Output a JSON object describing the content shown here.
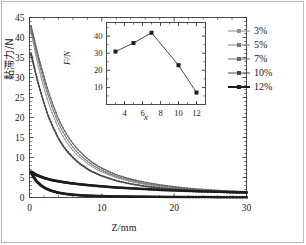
{
  "figure": {
    "width": 306,
    "height": 245,
    "background": "#ffffff",
    "frame_color": "#b9b9b9"
  },
  "legend": {
    "position": "right",
    "items": [
      {
        "label": "3%",
        "color": "#8c8c8c",
        "line_width": 0.9,
        "marker": "square"
      },
      {
        "label": "5%",
        "color": "#7a7a7a",
        "line_width": 1.0,
        "marker": "square"
      },
      {
        "label": "7%",
        "color": "#666666",
        "line_width": 1.1,
        "marker": "square"
      },
      {
        "label": "10%",
        "color": "#4a4a4a",
        "line_width": 1.4,
        "marker": "square"
      },
      {
        "label": "12%",
        "color": "#1c1c1c",
        "line_width": 2.0,
        "marker": "square"
      }
    ]
  },
  "chart_data": [
    {
      "id": "main",
      "type": "line",
      "title": "",
      "xlabel": "Z/mm",
      "ylabel": "黏滞力/N",
      "xlim": [
        0,
        30
      ],
      "ylim": [
        0,
        45
      ],
      "xticks": [
        0,
        10,
        20,
        30
      ],
      "yticks": [
        0,
        5,
        10,
        15,
        20,
        25,
        30,
        35,
        40,
        45
      ],
      "grid": false,
      "legend_position": "right-outside",
      "marker": "square",
      "series": [
        {
          "name": "3%",
          "color": "#8c8c8c",
          "x": [
            0.2,
            0.6,
            1.0,
            1.5,
            2.0,
            2.6,
            3.2,
            4.0,
            5.0,
            6.0,
            7.0,
            8.5,
            10.0,
            12.0,
            14.0,
            16.0,
            19.0,
            22.0,
            25.0,
            28.0,
            30.0
          ],
          "y": [
            41.5,
            38.0,
            34.6,
            30.8,
            27.4,
            23.8,
            20.8,
            17.4,
            14.2,
            11.8,
            10.0,
            7.9,
            6.4,
            5.0,
            4.0,
            3.3,
            2.5,
            2.0,
            1.6,
            1.3,
            1.2
          ]
        },
        {
          "name": "5%",
          "color": "#7a7a7a",
          "x": [
            0.2,
            0.6,
            1.0,
            1.5,
            2.0,
            2.6,
            3.2,
            4.0,
            5.0,
            6.0,
            7.0,
            8.5,
            10.0,
            12.0,
            14.0,
            16.0,
            19.0,
            22.0,
            25.0,
            28.0,
            30.0
          ],
          "y": [
            42.2,
            39.2,
            36.0,
            32.4,
            29.0,
            25.4,
            22.2,
            18.6,
            15.2,
            12.6,
            10.6,
            8.4,
            6.8,
            5.3,
            4.3,
            3.5,
            2.7,
            2.1,
            1.7,
            1.4,
            1.3
          ]
        },
        {
          "name": "7%",
          "color": "#666666",
          "x": [
            0.2,
            0.6,
            1.0,
            1.5,
            2.0,
            2.6,
            3.2,
            4.0,
            5.0,
            6.0,
            7.0,
            8.5,
            10.0,
            12.0,
            14.0,
            16.0,
            19.0,
            22.0,
            25.0,
            28.0,
            30.0
          ],
          "y": [
            42.8,
            40.0,
            37.0,
            33.5,
            30.2,
            26.6,
            23.4,
            19.7,
            16.2,
            13.5,
            11.4,
            9.0,
            7.3,
            5.7,
            4.6,
            3.8,
            2.9,
            2.3,
            1.9,
            1.6,
            1.4
          ]
        },
        {
          "name": "10%",
          "color": "#4a4a4a",
          "x": [
            0.2,
            0.6,
            1.0,
            1.5,
            2.0,
            2.6,
            3.2,
            4.0,
            5.0,
            6.0,
            7.0,
            8.5,
            10.0,
            12.0,
            14.0,
            16.0,
            19.0,
            22.0,
            25.0,
            28.0,
            30.0
          ],
          "y": [
            36.0,
            33.0,
            30.0,
            26.6,
            23.6,
            20.4,
            17.8,
            14.8,
            12.0,
            10.0,
            8.4,
            6.6,
            5.4,
            4.2,
            3.4,
            2.8,
            2.2,
            1.8,
            1.5,
            1.2,
            1.1
          ]
        },
        {
          "name": "12%",
          "color": "#1c1c1c",
          "x": [
            0.2,
            0.6,
            1.0,
            1.6,
            2.2,
            3.0,
            4.0,
            5.0,
            6.0,
            7.5,
            9.0,
            11.0,
            13.0,
            16.0,
            19.0,
            22.0,
            25.0,
            28.0,
            30.0
          ],
          "y": [
            6.4,
            5.0,
            4.0,
            3.0,
            2.3,
            1.7,
            1.2,
            0.9,
            0.7,
            0.5,
            0.4,
            0.3,
            0.25,
            0.2,
            0.15,
            0.12,
            0.1,
            0.08,
            0.07
          ]
        },
        {
          "name": "12%-upper-branch",
          "color": "#1c1c1c",
          "x": [
            0.3,
            1.0,
            2.0,
            3.0,
            4.5,
            6.0,
            8.0,
            10.0,
            12.0,
            15.0,
            18.0,
            21.0,
            24.0,
            27.0,
            30.0
          ],
          "y": [
            6.3,
            5.6,
            4.9,
            4.4,
            3.9,
            3.5,
            3.1,
            2.8,
            2.5,
            2.2,
            1.9,
            1.7,
            1.5,
            1.4,
            1.3
          ]
        }
      ]
    },
    {
      "id": "inset",
      "type": "line",
      "title": "",
      "xlabel": "x",
      "ylabel": "F/N",
      "xlim": [
        2,
        13
      ],
      "ylim": [
        0,
        48
      ],
      "xticks": [
        4,
        6,
        8,
        10,
        12
      ],
      "yticks": [
        10,
        20,
        30,
        40
      ],
      "grid": false,
      "marker": "square",
      "color": "#1c1c1c",
      "x": [
        3,
        5,
        7,
        10,
        12
      ],
      "y": [
        31,
        36,
        42,
        23,
        7
      ]
    }
  ]
}
